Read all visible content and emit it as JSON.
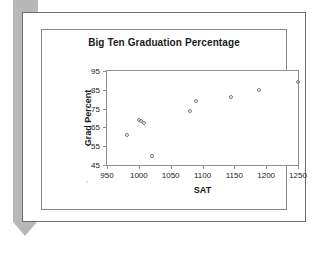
{
  "document": {
    "kind": "scanned-page",
    "background_color": "#ffffff",
    "artifact_color": "#b8b8b8",
    "frame_color": "#6d6d6d"
  },
  "chart_data": {
    "type": "scatter",
    "title": "Big Ten Graduation Percentage",
    "xlabel": "SAT",
    "ylabel": "Grad Percent",
    "xlim": [
      950,
      1250
    ],
    "ylim": [
      45,
      95
    ],
    "xticks": [
      950,
      1000,
      1050,
      1100,
      1150,
      1200,
      1250
    ],
    "yticks": [
      45,
      55,
      65,
      75,
      85,
      95
    ],
    "grid": false,
    "legend": false,
    "marker": "open-circle",
    "marker_color": "#7a7a7a",
    "points": [
      {
        "x": 981,
        "y": 61.0
      },
      {
        "x": 1000,
        "y": 69.0
      },
      {
        "x": 1003,
        "y": 68.5
      },
      {
        "x": 1008,
        "y": 67.5
      },
      {
        "x": 1020,
        "y": 50.0
      },
      {
        "x": 1080,
        "y": 73.5
      },
      {
        "x": 1090,
        "y": 79.0
      },
      {
        "x": 1145,
        "y": 81.0
      },
      {
        "x": 1189,
        "y": 85.0
      },
      {
        "x": 1250,
        "y": 89.0
      }
    ]
  }
}
